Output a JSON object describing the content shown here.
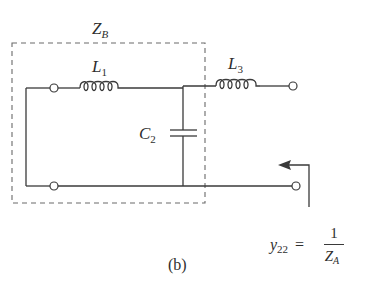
{
  "figure": {
    "caption": "(b)",
    "box_label": {
      "main": "Z",
      "sub": "B"
    },
    "components": [
      {
        "id": "L1",
        "type": "inductor",
        "main": "L",
        "sub": "1"
      },
      {
        "id": "C2",
        "type": "capacitor",
        "main": "C",
        "sub": "2"
      },
      {
        "id": "L3",
        "type": "inductor",
        "main": "L",
        "sub": "3"
      }
    ],
    "equation": {
      "lhs_main": "y",
      "lhs_sub": "22",
      "equals": "=",
      "numerator": "1",
      "denominator_main": "Z",
      "denominator_sub": "A"
    },
    "colors": {
      "line": "#3a3a3a",
      "dashed_box": "#6a6a6a",
      "text": "#2e2e2e",
      "background": "#ffffff"
    }
  }
}
